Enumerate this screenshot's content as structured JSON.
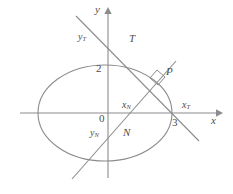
{
  "figure": {
    "name": "ellipse-tangent-normal-diagram",
    "stroke_color": "#8c8c8c",
    "text_color": "#4d4d4d",
    "background": "#ffffff",
    "axes": {
      "x_label": "x",
      "y_label": "y",
      "origin_label": "0"
    },
    "ticks": {
      "y_tick_label": "2",
      "x_tick_label": "3"
    },
    "curve": {
      "name": "ellipse",
      "center": [
        105,
        113
      ],
      "rx": 67,
      "ry": 48
    },
    "point": {
      "label": "P",
      "x": 160,
      "y": 78
    },
    "tangent": {
      "line_label": "T",
      "y_intercept_label": "yT",
      "y_intercept_text": "y",
      "y_intercept_sub": "T",
      "x_intercept_label": "xT",
      "x_intercept_text": "x",
      "x_intercept_sub": "T"
    },
    "normal": {
      "line_label": "N",
      "y_intercept_text": "y",
      "y_intercept_sub": "N",
      "x_intercept_text": "x",
      "x_intercept_sub": "N"
    },
    "right_angle_marker": "right-angle-square"
  }
}
